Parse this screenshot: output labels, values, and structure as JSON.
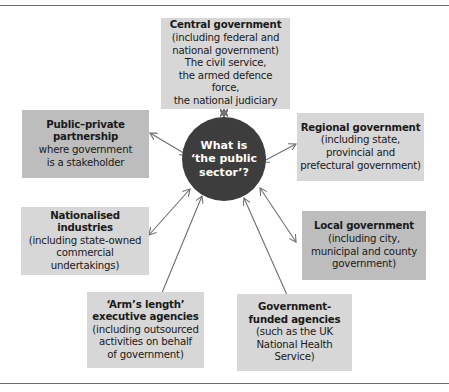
{
  "center": {
    "lines": [
      "What is",
      "‘the public",
      "sector’?"
    ]
  },
  "nodes": {
    "central": {
      "title": "Central government",
      "body": [
        "(including federal and",
        "national government)",
        "The civil service,",
        "the armed defence force,",
        "the national judiciary"
      ]
    },
    "ppp": {
      "title": [
        "Public–private",
        "partnership"
      ],
      "body": [
        "where government",
        "is a stakeholder"
      ]
    },
    "regional": {
      "title": "Regional government",
      "body": [
        "(including state,",
        "provincial and",
        "prefectural government)"
      ]
    },
    "nationalised": {
      "title": [
        "Nationalised",
        "industries"
      ],
      "body": [
        "(including state-owned",
        "commercial undertakings)"
      ]
    },
    "local": {
      "title": "Local government",
      "body": [
        "(including city,",
        "municipal and county",
        "government)"
      ]
    },
    "arms_length": {
      "title": [
        "‘Arm’s length’",
        "executive agencies"
      ],
      "body": [
        "(including outsourced",
        "activities on behalf",
        "of government)"
      ]
    },
    "gov_funded": {
      "title": [
        "Government-",
        "funded agencies"
      ],
      "body": [
        "(such as the UK",
        "National Health",
        "Service)"
      ]
    }
  },
  "colors": {
    "light_box": "#d7d7d7",
    "dark_box": "#bdbdbd",
    "circle": "#3d3d3d",
    "arrow": "#6e6e6e"
  }
}
